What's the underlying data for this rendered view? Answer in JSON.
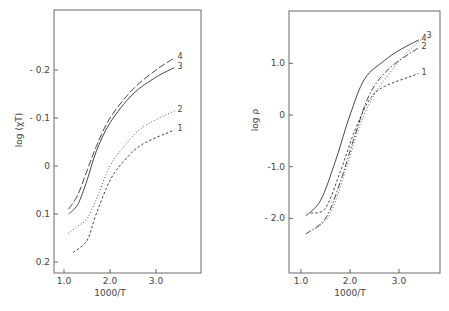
{
  "chart_data": [
    {
      "type": "line",
      "title": "",
      "xlabel": "1000/T",
      "ylabel": "log (χT)",
      "xlim": [
        0.8,
        4.0
      ],
      "ylim": [
        0.22,
        -0.3
      ],
      "y_inverted": true,
      "grid": false,
      "x_ticks": [
        {
          "value": 1.0,
          "label": "1.0"
        },
        {
          "value": 2.0,
          "label": "2.0"
        },
        {
          "value": 3.0,
          "label": "3.0"
        }
      ],
      "y_ticks": [
        {
          "value": -0.2,
          "label": "- 0.2"
        },
        {
          "value": -0.1,
          "label": "- 0.1"
        },
        {
          "value": 0.0,
          "label": "0"
        },
        {
          "value": 0.1,
          "label": "0.1"
        },
        {
          "value": 0.2,
          "label": "0.2"
        }
      ],
      "series": [
        {
          "name": "4",
          "style": "long-dash",
          "x": [
            1.1,
            1.3,
            1.5,
            1.7,
            2.0,
            2.5,
            3.0,
            3.4
          ],
          "y": [
            0.09,
            0.06,
            0.01,
            -0.04,
            -0.1,
            -0.16,
            -0.2,
            -0.225
          ]
        },
        {
          "name": "3",
          "style": "solid",
          "x": [
            1.1,
            1.3,
            1.5,
            1.7,
            2.0,
            2.5,
            3.0,
            3.4
          ],
          "y": [
            0.1,
            0.08,
            0.03,
            -0.03,
            -0.09,
            -0.15,
            -0.185,
            -0.205
          ]
        },
        {
          "name": "2",
          "style": "dotted",
          "x": [
            1.1,
            1.3,
            1.5,
            1.7,
            2.0,
            2.3,
            2.7,
            3.4
          ],
          "y": [
            0.14,
            0.125,
            0.11,
            0.07,
            0.0,
            -0.04,
            -0.08,
            -0.115
          ]
        },
        {
          "name": "1",
          "style": "short-dash",
          "x": [
            1.2,
            1.5,
            1.7,
            2.0,
            2.3,
            2.7,
            3.4
          ],
          "y": [
            0.18,
            0.155,
            0.1,
            0.03,
            -0.01,
            -0.045,
            -0.075
          ]
        }
      ]
    },
    {
      "type": "line",
      "title": "",
      "xlabel": "1000/T",
      "ylabel": "log ρ",
      "xlim": [
        0.8,
        3.9
      ],
      "ylim": [
        -3.0,
        2.0
      ],
      "y_inverted": false,
      "grid": false,
      "x_ticks": [
        {
          "value": 1.0,
          "label": "1.0"
        },
        {
          "value": 2.0,
          "label": "2.0"
        },
        {
          "value": 3.0,
          "label": "3.0"
        }
      ],
      "y_ticks": [
        {
          "value": 1.0,
          "label": "1.0"
        },
        {
          "value": 0.0,
          "label": "0"
        },
        {
          "value": -1.0,
          "label": "-1.0"
        },
        {
          "value": -2.0,
          "label": "- 2.0"
        }
      ],
      "series": [
        {
          "name": "4",
          "style": "solid",
          "x": [
            1.1,
            1.4,
            1.7,
            2.0,
            2.3,
            2.7,
            3.0,
            3.4
          ],
          "y": [
            -1.95,
            -1.65,
            -0.9,
            0.0,
            0.7,
            1.05,
            1.25,
            1.45
          ]
        },
        {
          "name": "3",
          "style": "dotted",
          "x": [
            1.3,
            1.6,
            1.9,
            2.2,
            2.5,
            2.8,
            3.1,
            3.5
          ],
          "y": [
            -2.2,
            -1.9,
            -1.1,
            -0.2,
            0.4,
            0.8,
            1.15,
            1.5
          ]
        },
        {
          "name": "2",
          "style": "dash-dot",
          "x": [
            1.1,
            1.5,
            1.8,
            2.1,
            2.4,
            2.8,
            3.4
          ],
          "y": [
            -2.3,
            -2.0,
            -1.3,
            -0.4,
            0.4,
            0.9,
            1.3
          ]
        },
        {
          "name": "1",
          "style": "short-dash",
          "x": [
            1.2,
            1.5,
            1.8,
            2.1,
            2.4,
            2.7,
            3.4
          ],
          "y": [
            -1.9,
            -1.8,
            -1.1,
            -0.3,
            0.3,
            0.55,
            0.8
          ]
        }
      ]
    }
  ]
}
